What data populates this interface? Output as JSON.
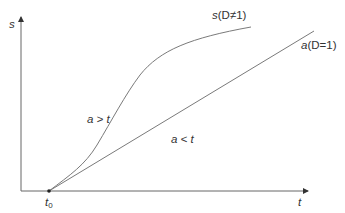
{
  "diagram": {
    "type": "growth curve comparison",
    "colors": {
      "axis": "#555555",
      "line": "#777777",
      "text": "#333333",
      "background": "#ffffff"
    },
    "axes": {
      "y_label": "s",
      "x_label": "t"
    },
    "origin_label": {
      "main": "t",
      "subscript": "0"
    },
    "curves": [
      {
        "id": "curve-s",
        "label_var": "s",
        "label_cond": "(D≠1)",
        "shape": "s-curve"
      },
      {
        "id": "line-a",
        "label_var": "a",
        "label_cond": "(D=1)",
        "shape": "straight"
      }
    ],
    "regions": [
      {
        "id": "region-above",
        "label": "a > t"
      },
      {
        "id": "region-below",
        "label": "a < t"
      }
    ]
  }
}
